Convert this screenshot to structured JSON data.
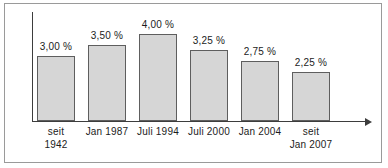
{
  "chart_data": {
    "type": "bar",
    "title": "",
    "subtitle": "",
    "xlabel": "",
    "ylabel": "",
    "grid": false,
    "legend": false,
    "ylim": [
      0,
      4.5
    ],
    "categories": [
      "seit 1942",
      "Jan 1987",
      "Juli 1994",
      "Juli 2000",
      "Jan 2004",
      "seit Jan 2007"
    ],
    "category_lines": [
      [
        "seit",
        "1942"
      ],
      [
        "Jan 1987"
      ],
      [
        "Juli 1994"
      ],
      [
        "Juli 2000"
      ],
      [
        "Jan 2004"
      ],
      [
        "seit",
        "Jan 2007"
      ]
    ],
    "values": [
      3.0,
      3.5,
      4.0,
      3.25,
      2.75,
      2.25
    ],
    "value_labels": [
      "3,00 %",
      "3,50 %",
      "4,00 %",
      "3,25 %",
      "2,75 %",
      "2,25 %"
    ],
    "bar_color": "#d6d6d6",
    "bar_border_color": "#5e5e5e",
    "axis_color": "#3d3d3d",
    "frame_color": "#9a9a9a",
    "text_color": "#1c1c1c"
  },
  "layout": {
    "baseline_y": 117,
    "px_per_unit": 21.7,
    "bar_width": 38,
    "bar_left_positions": [
      32,
      83,
      134,
      185,
      236,
      287
    ],
    "axis_left": 27,
    "axis_right": 360,
    "axis_top": 8
  }
}
